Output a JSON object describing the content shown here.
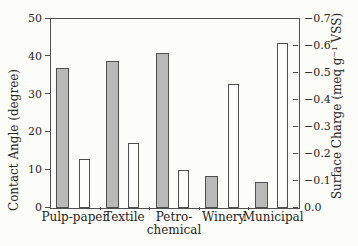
{
  "figure": {
    "background": "#fcfcf8",
    "axis_color": "#4f4f4f",
    "text_color": "#262626"
  },
  "chart_data": {
    "type": "bar",
    "title": "",
    "categories": [
      "Pulp-paper",
      "Textile",
      "Petro-chemical",
      "Winery",
      "Municipal"
    ],
    "series": [
      {
        "name": "Contact Angle",
        "axis": "left",
        "fill": "#b9b9b9",
        "stroke": "#4f4f4f",
        "values": [
          37,
          39,
          41,
          8.5,
          7
        ]
      },
      {
        "name": "Surface Charge",
        "axis": "right",
        "fill": "#fdfdfb",
        "stroke": "#4f4f4f",
        "values": [
          -0.18,
          -0.24,
          -0.14,
          -0.46,
          -0.61
        ]
      }
    ],
    "left_axis": {
      "label": "Contact Angle (degree)",
      "min": 0,
      "max": 50,
      "ticks": [
        0,
        10,
        20,
        30,
        40,
        50
      ]
    },
    "right_axis": {
      "label": "Surface Charge (meq g⁻¹ VSS)",
      "min": 0,
      "max": 0.7,
      "ticks": [
        "0.0",
        "−0.1",
        "−0.2",
        "−0.3",
        "−0.4",
        "−0.5",
        "−0.6",
        "−0.7"
      ]
    },
    "grid": false,
    "legend": null
  }
}
